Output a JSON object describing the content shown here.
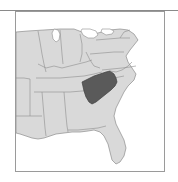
{
  "figure": {
    "type": "locator-map",
    "title": "",
    "region_depicted": "Eastern United States",
    "frame": {
      "border_color": "#9a9a9a",
      "background_color": "#ffffff"
    },
    "top_rule_color": "#8a8a8a"
  },
  "map": {
    "land_fill_color": "#d9d9d9",
    "land_border_color": "#8d8d8d",
    "water_fill_color": "#ffffff",
    "highlight_fill_color": "#5a5a5a",
    "highlight_border_color": "#3f3f3f",
    "highlighted_state": "South Carolina",
    "highlighted_state_label": "",
    "features": [
      {
        "name": "Great Lakes",
        "kind": "water"
      },
      {
        "name": "Atlantic Ocean",
        "kind": "water"
      },
      {
        "name": "Gulf of Mexico",
        "kind": "water"
      },
      {
        "name": "Florida Peninsula",
        "kind": "land"
      }
    ]
  },
  "labels": {
    "none_visible": ""
  }
}
